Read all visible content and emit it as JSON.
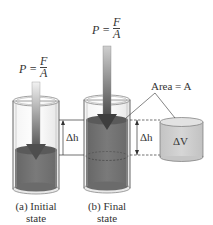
{
  "diagram": {
    "type": "physics-illustration",
    "colors": {
      "fluid": "#6e6e6e",
      "fluid_top": "#5a5a5a",
      "cylinder_wall": "#d8d8d8",
      "cylinder_outline": "#888888",
      "arrow_light": "#e8e8e8",
      "arrow_dark": "#5e5e5e",
      "volume_cylinder": "#c9c9c9",
      "volume_top": "#dedede"
    },
    "panels": [
      {
        "id": "a",
        "pressure_label": {
          "lhs": "P =",
          "numerator": "F",
          "denominator": "A"
        },
        "caption_line1": "(a) Initial",
        "caption_line2": "state"
      },
      {
        "id": "b",
        "pressure_label": {
          "lhs": "P =",
          "numerator": "F",
          "denominator": "A"
        },
        "caption_line1": "(b) Final",
        "caption_line2": "state"
      }
    ],
    "annotations": {
      "delta_h_left": "Δh",
      "delta_h_right": "Δh",
      "area_label": "Area = A",
      "delta_v": "ΔV"
    }
  }
}
